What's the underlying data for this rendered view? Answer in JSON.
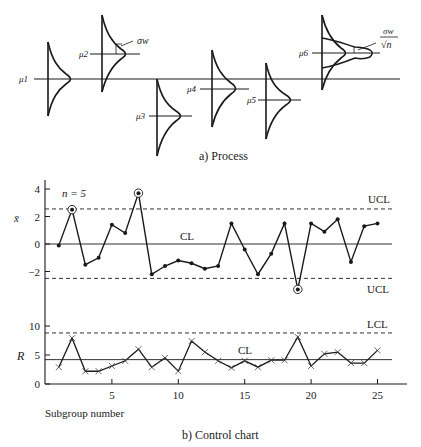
{
  "process_diagram": {
    "caption": "a) Process",
    "mean_labels": [
      "μ1",
      "μ2",
      "μ3",
      "μ4",
      "μ5",
      "μ6"
    ],
    "sigma_label": "σw",
    "sigma_mean_label_num": "σw",
    "sigma_mean_label_den": "√n"
  },
  "control_chart": {
    "caption": "b) Control chart",
    "xlabel": "Subgroup number",
    "sample_size_label": "n = 5",
    "xbar": {
      "ylabel": "x̄",
      "yticks": [
        "4",
        "2",
        "0",
        "−2"
      ],
      "upper_label": "UCL",
      "center_label": "CL",
      "lower_label": "UCL"
    },
    "range": {
      "ylabel": "R",
      "yticks": [
        "10",
        "5",
        "0"
      ],
      "upper_label": "LCL",
      "center_label": "CL"
    },
    "xticks": [
      "5",
      "10",
      "15",
      "20",
      "25"
    ]
  },
  "chart_data": [
    {
      "type": "line",
      "title": "X-bar control chart",
      "xlabel": "Subgroup number",
      "ylabel": "x̄",
      "x": [
        1,
        2,
        3,
        4,
        5,
        6,
        7,
        8,
        9,
        10,
        11,
        12,
        13,
        14,
        15,
        16,
        17,
        18,
        19,
        20,
        21,
        22,
        23,
        24,
        25
      ],
      "values": [
        -0.1,
        2.5,
        -1.5,
        -1.0,
        1.4,
        0.8,
        3.7,
        -2.2,
        -1.6,
        -1.2,
        -1.4,
        -1.8,
        -1.6,
        1.5,
        -0.4,
        -2.2,
        -0.7,
        1.5,
        -3.3,
        1.5,
        0.9,
        1.8,
        -1.3,
        1.3,
        1.5
      ],
      "out_of_control_points": [
        2,
        7,
        19
      ],
      "center_line": 0,
      "upper_control_limit": 2.55,
      "lower_control_limit": -2.5,
      "ylim": [
        -5,
        4.5
      ],
      "xlim": [
        0,
        26
      ],
      "yticks": [
        4,
        2,
        0,
        -2
      ],
      "annotations": [
        "n = 5",
        "CL",
        "UCL",
        "UCL"
      ],
      "grid": false
    },
    {
      "type": "line",
      "title": "R control chart",
      "xlabel": "Subgroup number",
      "ylabel": "R",
      "x": [
        1,
        2,
        3,
        4,
        5,
        6,
        7,
        8,
        9,
        10,
        11,
        12,
        13,
        14,
        15,
        16,
        17,
        18,
        19,
        20,
        21,
        22,
        23,
        24,
        25
      ],
      "values": [
        2.9,
        7.9,
        2.2,
        2.2,
        3.1,
        4.0,
        6.0,
        2.9,
        4.5,
        2.2,
        7.4,
        5.5,
        4.0,
        2.8,
        4.0,
        2.9,
        4.1,
        4.1,
        8.1,
        3.1,
        5.2,
        5.5,
        3.6,
        3.6,
        5.8
      ],
      "center_line": 4.2,
      "upper_limit_line": 8.8,
      "ylim": [
        0,
        12
      ],
      "xlim": [
        0,
        26
      ],
      "yticks": [
        0,
        5,
        10
      ],
      "xticks": [
        5,
        10,
        15,
        20,
        25
      ],
      "annotations": [
        "CL",
        "LCL"
      ],
      "grid": false
    }
  ]
}
